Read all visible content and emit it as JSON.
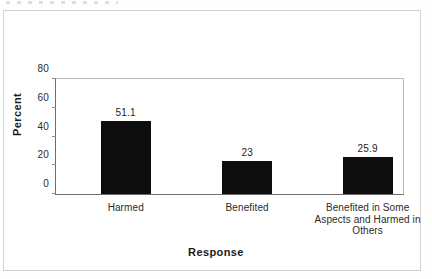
{
  "figure": {
    "background_color": "#ffffff",
    "frame_color": "#d2d2d2",
    "axis_color": "#6e6e6e",
    "bar_color": "#0d0d0d"
  },
  "chart_data": {
    "type": "bar",
    "title": "",
    "subtitle": "",
    "xlabel": "Response",
    "ylabel": "Percent",
    "categories": [
      "Harmed",
      "Benefited",
      "Benefited in Some Aspects and Harmed in Others"
    ],
    "category_label_lines": [
      [
        "Harmed"
      ],
      [
        "Benefited"
      ],
      [
        "Benefited in Some",
        "Aspects and Harmed in",
        "Others"
      ]
    ],
    "values": [
      51.1,
      23,
      25.9
    ],
    "value_labels": [
      "51.1",
      "23",
      "25.9"
    ],
    "ylim": [
      0,
      80
    ],
    "yticks": [
      0,
      20,
      40,
      60,
      80
    ],
    "ytick_labels": [
      "0",
      "20",
      "40",
      "60",
      "80"
    ],
    "grid": false,
    "legend": null,
    "legend_position": "none",
    "annotations": []
  }
}
